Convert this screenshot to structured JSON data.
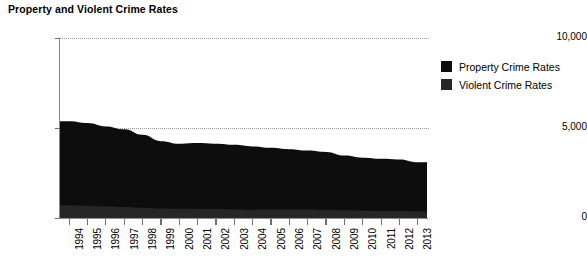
{
  "chart_data": {
    "type": "area",
    "title": "Property and Violent Crime Rates",
    "xlabel": "",
    "ylabel": "",
    "ylim": [
      0,
      10000
    ],
    "yticks": [
      "0",
      "5,000",
      "10,000"
    ],
    "ytick_values": [
      0,
      5000,
      10000
    ],
    "grid": true,
    "stacked": true,
    "legend_position": "right",
    "categories": [
      "1994",
      "1995",
      "1996",
      "1997",
      "1998",
      "1999",
      "2000",
      "2001",
      "2002",
      "2003",
      "2004",
      "2005",
      "2006",
      "2007",
      "2008",
      "2009",
      "2010",
      "2011",
      "2012",
      "2013"
    ],
    "series": [
      {
        "name": "Violent Crime Rates",
        "color": "#262626",
        "values": [
          714,
          685,
          637,
          611,
          568,
          523,
          507,
          505,
          494,
          476,
          463,
          469,
          479,
          472,
          458,
          432,
          405,
          387,
          387,
          368
        ]
      },
      {
        "name": "Property Crime Rates",
        "color": "#0d0d0d",
        "values": [
          4660,
          4591,
          4451,
          4316,
          4052,
          3744,
          3618,
          3658,
          3631,
          3591,
          3514,
          3431,
          3346,
          3276,
          3215,
          3041,
          2946,
          2905,
          2868,
          2731
        ]
      }
    ],
    "totals": [
      5374,
      5276,
      5088,
      4927,
      4620,
      4267,
      4125,
      4163,
      4125,
      4067,
      3977,
      3900,
      3825,
      3748,
      3673,
      3473,
      3351,
      3292,
      3255,
      3099
    ]
  },
  "legend": {
    "items": [
      {
        "label": "Property Crime Rates",
        "color": "#0d0d0d"
      },
      {
        "label": "Violent Crime Rates",
        "color": "#262626"
      }
    ]
  }
}
